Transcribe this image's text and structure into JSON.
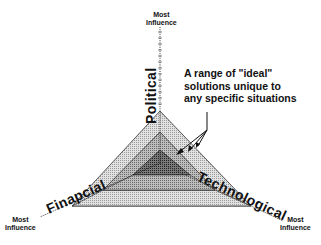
{
  "diagram": {
    "axes": [
      {
        "name": "Political",
        "end_label_line1": "Most",
        "end_label_line2": "Influence"
      },
      {
        "name": "Technological",
        "end_label_line1": "Most",
        "end_label_line2": "Influence"
      },
      {
        "name": "Finapcial",
        "end_label_line1": "Most",
        "end_label_line2": "Influence"
      }
    ],
    "annotation": {
      "line1": "A range of \"ideal\"",
      "line2": "solutions unique to",
      "line3": "any specific situations"
    },
    "layers": [
      {
        "level": "outer",
        "fill": "#d4d4d4"
      },
      {
        "level": "middle",
        "fill": "#a8a8a8"
      },
      {
        "level": "inner",
        "fill": "#5a5a5a"
      }
    ]
  }
}
